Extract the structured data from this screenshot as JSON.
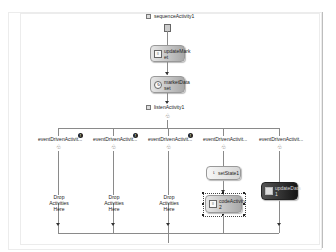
{
  "designer": {
    "sequence": {
      "label": "sequenceActivity1"
    },
    "nodes": {
      "update": {
        "label": "updateMark et",
        "icon": "code-icon"
      },
      "market": {
        "label": "marketData set",
        "icon": "invoke-icon"
      }
    },
    "listen": {
      "label": "listenActivity1"
    },
    "branches": [
      {
        "label": "eventDrivenActivit...",
        "drop_text": "Drop Activities Here",
        "warning": "!"
      },
      {
        "label": "eventDrivenActivit...",
        "drop_text": "Drop Activities Here",
        "warning": "!"
      },
      {
        "label": "eventDrivenActivit...",
        "drop_text": "Drop Activities Here",
        "warning": "!"
      },
      {
        "label": "eventDrivenActivit...",
        "children": [
          {
            "label": "setState1"
          },
          {
            "label": "codeActivity 2"
          }
        ]
      },
      {
        "label": "eventDrivenActivit...",
        "children": [
          {
            "label": "updateData 1"
          }
        ]
      }
    ]
  },
  "colors": {
    "connector": "#8a8a8a",
    "node_light": "#e6e6e6",
    "node_dark": "#151515"
  }
}
